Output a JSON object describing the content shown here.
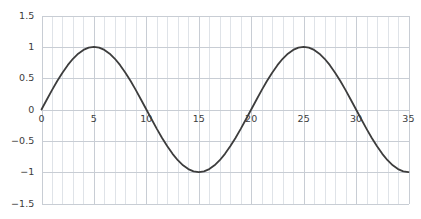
{
  "chart_data": {
    "type": "line",
    "title": "",
    "subtitle": "",
    "xlabel": "",
    "ylabel": "",
    "xlim": [
      0,
      35
    ],
    "ylim": [
      -1.5,
      1.5
    ],
    "grid": true,
    "grid_minor_x": true,
    "grid_minor_x_step": 1,
    "legend": "none",
    "x_ticks": [
      0,
      5,
      10,
      15,
      20,
      25,
      30,
      35
    ],
    "x_tick_labels": [
      "0",
      "5",
      "10",
      "15",
      "20",
      "25",
      "30",
      "35"
    ],
    "y_ticks": [
      -1.5,
      -1,
      -0.5,
      0,
      0.5,
      1,
      1.5
    ],
    "y_tick_labels": [
      "−1.5",
      "−1",
      "−0.5",
      "0",
      "0.5",
      "1",
      "1.5"
    ],
    "series": [
      {
        "name": "sine",
        "color": "#3d3d3d",
        "line_width": 1.8,
        "formula": "y = sin(2*pi*x/20)",
        "x": [
          0,
          0.5,
          1,
          1.5,
          2,
          2.5,
          3,
          3.5,
          4,
          4.5,
          5,
          5.5,
          6,
          6.5,
          7,
          7.5,
          8,
          8.5,
          9,
          9.5,
          10,
          10.5,
          11,
          11.5,
          12,
          12.5,
          13,
          13.5,
          14,
          14.5,
          15,
          15.5,
          16,
          16.5,
          17,
          17.5,
          18,
          18.5,
          19,
          19.5,
          20,
          20.5,
          21,
          21.5,
          22,
          22.5,
          23,
          23.5,
          24,
          24.5,
          25,
          25.5,
          26,
          26.5,
          27,
          27.5,
          28,
          28.5,
          29,
          29.5,
          30,
          30.5,
          31,
          31.5,
          32,
          32.5,
          33,
          33.5,
          34,
          34.5,
          35
        ],
        "y": [
          0,
          0.156,
          0.309,
          0.454,
          0.588,
          0.707,
          0.809,
          0.891,
          0.951,
          0.988,
          1,
          0.988,
          0.951,
          0.891,
          0.809,
          0.707,
          0.588,
          0.454,
          0.309,
          0.156,
          0,
          -0.156,
          -0.309,
          -0.454,
          -0.588,
          -0.707,
          -0.809,
          -0.891,
          -0.951,
          -0.988,
          -1,
          -0.988,
          -0.951,
          -0.891,
          -0.809,
          -0.707,
          -0.588,
          -0.454,
          -0.309,
          -0.156,
          0,
          0.156,
          0.309,
          0.454,
          0.588,
          0.707,
          0.809,
          0.891,
          0.951,
          0.988,
          1,
          0.988,
          0.951,
          0.891,
          0.809,
          0.707,
          0.588,
          0.454,
          0.309,
          0.156,
          0,
          -0.156,
          -0.309,
          -0.454,
          -0.588,
          -0.707,
          -0.809,
          -0.891,
          -0.951,
          -0.988,
          -1
        ]
      }
    ],
    "colors": {
      "line": "#3d3d3d",
      "grid_major": "#c8cdd4",
      "grid_minor": "#dfe3e8",
      "axis_text": "#3c3c3c",
      "background": "#ffffff"
    }
  }
}
